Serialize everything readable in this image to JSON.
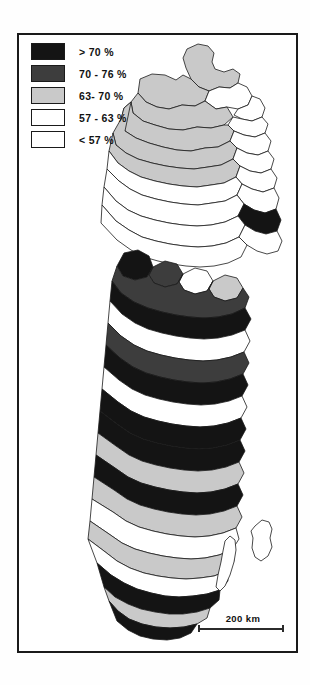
{
  "figure": {
    "frame": "map-border"
  },
  "legend": {
    "items": [
      {
        "label": "> 70 %",
        "swatch": "black-fill",
        "color": "#141414"
      },
      {
        "label": "70 - 76 %",
        "swatch": "dark-gray-fill",
        "color": "#3d3d3d"
      },
      {
        "label": "63- 70 %",
        "swatch": "light-gray-fill",
        "color": "#c9c9c9"
      },
      {
        "label": "57 - 63 %",
        "swatch": "white-fill",
        "color": "#ffffff"
      },
      {
        "label": "< 57 %",
        "swatch": "white-fill",
        "color": "#ffffff"
      }
    ]
  },
  "scalebar": {
    "label": "200 km"
  },
  "chart_data": {
    "type": "map",
    "title": "",
    "classes": [
      "> 70 %",
      "70 - 76 %",
      "63- 70 %",
      "57 - 63 %",
      "< 57 %"
    ],
    "class_colors": [
      "#141414",
      "#3d3d3d",
      "#c9c9c9",
      "#ffffff",
      "#ffffff"
    ],
    "scale_label": "200 km",
    "regions": [
      {
        "id": "r1",
        "class": 2,
        "d": "M168,14 L179,9 L189,11 L195,18 L193,27 L196,34 L205,37 L214,34 L221,39 L219,48 L211,53 L200,52 L190,56 L180,52 L172,44 L167,33 L164,23 Z"
      },
      {
        "id": "r2",
        "class": 2,
        "d": "M121,44 L133,39 L146,40 L157,45 L164,40 L172,44 L180,52 L190,56 L186,66 L176,71 L163,70 L150,74 L138,72 L127,67 L119,58 Z"
      },
      {
        "id": "r3",
        "class": 3,
        "d": "M190,56 L200,52 L211,53 L219,48 L228,52 L233,61 L229,70 L219,74 L208,72 L197,74 L186,66 Z"
      },
      {
        "id": "r4",
        "class": 3,
        "d": "M219,74 L229,70 L233,61 L241,64 L246,73 L243,82 L233,86 L223,84 L215,80 Z"
      },
      {
        "id": "r5",
        "class": 2,
        "d": "M119,58 L127,67 L138,72 L150,74 L163,70 L176,71 L186,66 L197,74 L208,72 L214,82 L205,90 L192,93 L178,92 L164,95 L150,94 L136,90 L124,86 L114,78 L112,67 Z"
      },
      {
        "id": "r6",
        "class": 3,
        "d": "M214,82 L223,84 L233,86 L243,82 L249,89 L246,98 L236,102 L225,100 L215,96 L209,90 Z"
      },
      {
        "id": "r7",
        "class": 2,
        "d": "M112,67 L114,78 L124,86 L136,90 L150,94 L164,95 L178,92 L192,93 L205,90 L209,90 L215,96 L211,106 L199,112 L186,113 L172,116 L158,115 L144,112 L130,108 L117,103 L106,96 L102,84 L105,73 Z"
      },
      {
        "id": "r8",
        "class": 3,
        "d": "M215,96 L225,100 L236,102 L246,98 L252,106 L249,116 L239,120 L228,118 L218,113 L211,106 Z"
      },
      {
        "id": "r9",
        "class": 2,
        "d": "M102,84 L105,73 L112,67 L106,96 L117,103 L130,108 L144,112 L158,115 L172,116 L186,113 L199,112 L211,106 L218,113 L214,124 L202,130 L189,132 L175,134 L161,133 L147,131 L133,128 L119,124 L107,118 L97,110 L94,98 Z"
      },
      {
        "id": "r10",
        "class": 3,
        "d": "M218,113 L228,118 L239,120 L249,116 L255,124 L252,134 L242,138 L231,136 L221,131 L214,124 Z"
      },
      {
        "id": "r11",
        "class": 2,
        "d": "M94,98 L97,110 L107,118 L119,124 L133,128 L147,131 L161,133 L175,134 L189,132 L202,130 L214,124 L221,131 L217,142 L205,148 L192,150 L178,152 L164,151 L150,149 L136,146 L122,142 L110,136 L99,128 L90,116 Z"
      },
      {
        "id": "r12",
        "class": 3,
        "d": "M221,131 L231,136 L242,138 L252,134 L258,143 L255,153 L244,157 L233,154 L223,149 L217,142 Z"
      },
      {
        "id": "r13",
        "class": 3,
        "d": "M90,116 L99,128 L110,136 L122,142 L136,146 L150,149 L164,151 L178,152 L192,150 L205,148 L217,142 L223,149 L218,160 L206,166 L193,168 L179,170 L165,169 L151,167 L137,164 L123,160 L111,154 L100,146 L88,134 Z"
      },
      {
        "id": "r14",
        "class": 3,
        "d": "M223,149 L233,154 L244,157 L255,153 L260,163 L257,174 L246,178 L235,175 L225,169 L218,160 Z"
      },
      {
        "id": "r15",
        "class": 3,
        "d": "M88,134 L100,146 L111,154 L123,160 L137,164 L151,167 L165,169 L179,170 L193,168 L206,166 L218,160 L225,169 L219,181 L206,187 L192,190 L178,191 L164,190 L150,188 L136,185 L122,181 L109,175 L97,166 L85,152 Z"
      },
      {
        "id": "r16",
        "class": 0,
        "d": "M225,169 L235,175 L246,178 L257,174 L262,185 L258,196 L247,199 L236,196 L226,190 L219,181 Z"
      },
      {
        "id": "r17",
        "class": 3,
        "d": "M85,152 L97,166 L109,175 L122,181 L136,185 L150,188 L164,190 L178,191 L192,190 L206,187 L219,181 L226,190 L220,202 L207,208 L193,211 L179,212 L165,211 L151,209 L137,206 L123,202 L110,195 L97,186 L83,170 Z"
      },
      {
        "id": "r18",
        "class": 3,
        "d": "M226,190 L236,196 L247,199 L258,196 L263,206 L259,216 L248,219 L238,216 L228,210 L220,202 Z"
      },
      {
        "id": "r19",
        "class": 3,
        "d": "M83,170 L97,186 L110,195 L123,202 L137,206 L151,209 L165,211 L179,212 L193,211 L207,208 L220,202 L228,210 L222,222 L209,228 L195,231 L181,232 L167,231 L153,229 L139,226 L125,222 L112,215 L98,205 L82,188 Z"
      },
      {
        "id": "r20",
        "class": 0,
        "d": "M105,218 L119,215 L130,221 L134,232 L128,242 L116,245 L104,241 L98,231 Z"
      },
      {
        "id": "r21",
        "class": 1,
        "d": "M134,232 L146,226 L158,229 L164,239 L158,249 L146,252 L135,248 L130,240 Z"
      },
      {
        "id": "r22",
        "class": 3,
        "d": "M164,239 L176,233 L188,236 L194,246 L188,256 L176,259 L165,255 L160,247 Z"
      },
      {
        "id": "r23",
        "class": 2,
        "d": "M194,246 L206,240 L218,243 L224,253 L218,263 L206,266 L195,262 L190,254 Z"
      },
      {
        "id": "r24",
        "class": 1,
        "d": "M98,231 L104,241 L116,245 L128,242 L134,232 L130,240 L135,248 L146,252 L158,249 L164,239 L160,247 L165,255 L176,259 L188,256 L194,246 L190,254 L195,262 L206,266 L218,263 L224,253 L230,262 L226,273 L213,279 L199,282 L185,283 L171,282 L157,280 L143,277 L129,273 L115,267 L102,258 L93,246 Z"
      },
      {
        "id": "r25",
        "class": 0,
        "d": "M93,246 L102,258 L115,267 L129,273 L143,277 L157,280 L171,282 L185,283 L199,282 L213,279 L226,273 L232,284 L226,295 L213,300 L199,303 L185,304 L171,303 L157,301 L143,298 L129,294 L116,288 L103,279 L91,266 Z"
      },
      {
        "id": "r26",
        "class": 3,
        "d": "M91,266 L103,279 L116,288 L129,294 L143,298 L157,301 L171,303 L185,304 L199,303 L213,300 L226,295 L231,306 L225,317 L212,322 L198,325 L184,326 L170,325 L156,323 L142,320 L128,316 L115,310 L102,301 L89,288 Z"
      },
      {
        "id": "r27",
        "class": 1,
        "d": "M89,288 L102,301 L115,310 L128,316 L142,320 L156,323 L170,325 L184,326 L198,325 L212,322 L225,317 L230,328 L224,339 L211,344 L197,347 L183,348 L169,347 L155,345 L141,342 L127,338 L114,332 L101,323 L87,310 Z"
      },
      {
        "id": "r28",
        "class": 0,
        "d": "M87,310 L101,323 L114,332 L127,338 L141,342 L155,345 L169,347 L183,348 L197,347 L211,344 L224,339 L229,350 L223,361 L210,366 L196,369 L182,370 L168,369 L154,367 L140,364 L126,360 L113,354 L100,345 L85,332 Z"
      },
      {
        "id": "r29",
        "class": 3,
        "d": "M85,332 L100,345 L113,354 L126,360 L140,364 L154,367 L168,369 L182,370 L196,369 L210,366 L223,361 L228,372 L222,383 L209,388 L195,391 L181,392 L167,391 L153,389 L139,386 L125,382 L112,376 L99,367 L83,354 Z"
      },
      {
        "id": "r30",
        "class": 0,
        "d": "M83,354 L99,367 L112,376 L125,382 L139,386 L153,389 L167,391 L181,392 L195,391 L209,388 L222,383 L227,394 L221,405 L208,410 L194,413 L180,414 L166,413 L152,411 L138,408 L124,404 L111,398 L98,389 L81,376 Z"
      },
      {
        "id": "r31",
        "class": 0,
        "d": "M81,376 L98,389 L111,398 L124,404 L138,408 L152,411 L166,413 L180,414 L194,413 L208,410 L221,405 L226,416 L220,427 L207,432 L193,435 L179,436 L165,435 L151,433 L137,430 L123,426 L110,420 L97,411 L79,398 Z"
      },
      {
        "id": "r32",
        "class": 2,
        "d": "M79,398 L97,411 L110,420 L123,426 L137,430 L151,433 L165,435 L179,436 L193,435 L207,432 L220,427 L225,438 L219,449 L206,454 L192,457 L178,458 L164,457 L150,455 L136,452 L122,448 L109,442 L96,433 L77,420 Z"
      },
      {
        "id": "r33",
        "class": 0,
        "d": "M77,420 L96,433 L109,442 L122,448 L136,452 L150,455 L164,457 L178,458 L192,457 L206,454 L219,449 L224,460 L218,471 L205,476 L191,479 L177,480 L163,479 L149,477 L135,474 L121,470 L108,464 L95,455 L75,442 Z"
      },
      {
        "id": "r34",
        "class": 2,
        "d": "M75,442 L95,455 L108,464 L121,470 L135,474 L149,477 L163,479 L177,480 L191,479 L205,476 L218,471 L223,482 L217,493 L204,498 L190,501 L176,502 L162,501 L148,499 L134,496 L120,492 L107,486 L94,477 L73,464 Z"
      },
      {
        "id": "r35",
        "class": 3,
        "d": "M73,464 L94,477 L107,486 L120,492 L134,496 L148,499 L162,501 L176,502 L190,501 L204,498 L217,493 L220,504 L213,515 L200,520 L186,523 L172,524 L158,523 L144,521 L130,518 L116,514 L103,508 L90,499 L71,486 Z"
      },
      {
        "id": "r36",
        "class": 2,
        "d": "M71,486 L90,499 L103,508 L116,514 L130,518 L144,521 L158,523 L172,524 L186,523 L200,520 L213,515 L215,526 L208,536 L195,541 L181,543 L167,544 L153,543 L139,541 L125,538 L111,533 L98,526 L85,516 L69,504 Z"
      },
      {
        "id": "r37",
        "class": 3,
        "d": "M69,504 L85,516 L98,526 L111,533 L125,538 L139,541 L153,543 L167,544 L181,543 L195,541 L208,536 L209,546 L201,555 L188,559 L174,561 L160,562 L146,561 L132,558 L118,554 L105,548 L92,540 L78,528 Z"
      },
      {
        "id": "r38",
        "class": 0,
        "d": "M78,528 L92,540 L105,548 L118,554 L132,558 L146,561 L160,562 L174,561 L188,559 L201,555 L200,565 L191,573 L178,577 L164,579 L150,579 L136,577 L122,574 L109,569 L96,562 L85,552 Z"
      },
      {
        "id": "r39",
        "class": 2,
        "d": "M85,552 L96,562 L109,569 L122,574 L136,577 L150,579 L164,579 L178,577 L191,573 L188,583 L178,589 L165,592 L151,593 L137,592 L123,589 L110,584 L99,576 L90,566 Z"
      },
      {
        "id": "r40",
        "class": 0,
        "d": "M90,566 L99,576 L110,584 L123,589 L137,592 L151,593 L165,592 L178,589 L172,598 L161,603 L148,605 L134,604 L121,601 L109,595 L98,586 Z"
      },
      {
        "id": "gotland",
        "class": 3,
        "d": "M236,491 L243,485 L250,487 L253,494 L251,503 L253,512 L249,521 L242,526 L236,522 L233,513 L234,503 L232,496 Z"
      },
      {
        "id": "oland",
        "class": 3,
        "d": "M206,506 L211,501 L216,505 L217,515 L215,527 L211,540 L206,551 L201,556 L197,552 L199,540 L202,527 L204,516 Z"
      }
    ]
  }
}
